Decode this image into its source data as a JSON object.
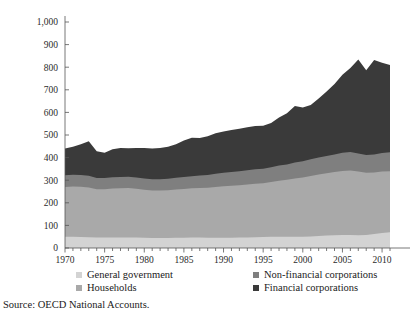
{
  "chart_data": {
    "type": "area",
    "title": "",
    "subtitle": "",
    "xlabel": "",
    "ylabel": "",
    "stacked": true,
    "grid": false,
    "legend_position": "bottom",
    "xlim": [
      1970,
      2011
    ],
    "ylim": [
      0,
      1000
    ],
    "ytick_values": [
      0,
      100,
      200,
      300,
      400,
      500,
      600,
      700,
      800,
      900,
      1000
    ],
    "ytick_labels": [
      "0",
      "100",
      "200",
      "300",
      "400",
      "500",
      "600",
      "700",
      "800",
      "900",
      "1,000"
    ],
    "xtick_values": [
      1970,
      1975,
      1980,
      1985,
      1990,
      1995,
      2000,
      2005,
      2010
    ],
    "xtick_labels": [
      "1970",
      "1975",
      "1980",
      "1985",
      "1990",
      "1995",
      "2000",
      "2005",
      "2010"
    ],
    "x": [
      1970,
      1971,
      1972,
      1973,
      1974,
      1975,
      1976,
      1977,
      1978,
      1979,
      1980,
      1981,
      1982,
      1983,
      1984,
      1985,
      1986,
      1987,
      1988,
      1989,
      1990,
      1991,
      1992,
      1993,
      1994,
      1995,
      1996,
      1997,
      1998,
      1999,
      2000,
      2001,
      2002,
      2003,
      2004,
      2005,
      2006,
      2007,
      2008,
      2009,
      2010,
      2011
    ],
    "series": [
      {
        "name": "General government",
        "color": "#d3d3d3",
        "values": [
          50,
          50,
          49,
          48,
          46,
          46,
          47,
          47,
          47,
          46,
          45,
          44,
          44,
          44,
          45,
          45,
          46,
          46,
          45,
          45,
          45,
          45,
          46,
          47,
          48,
          49,
          50,
          50,
          50,
          50,
          50,
          51,
          53,
          55,
          56,
          57,
          57,
          56,
          57,
          62,
          66,
          70
        ]
      },
      {
        "name": "Households",
        "color": "#a9a9a9",
        "values": [
          220,
          222,
          222,
          220,
          214,
          214,
          216,
          217,
          218,
          216,
          213,
          210,
          210,
          211,
          214,
          216,
          218,
          220,
          222,
          225,
          228,
          230,
          232,
          234,
          236,
          238,
          242,
          248,
          252,
          258,
          262,
          268,
          272,
          276,
          280,
          284,
          286,
          282,
          276,
          272,
          272,
          270
        ]
      },
      {
        "name": "Non-financial corporations",
        "color": "#7f7f7f",
        "values": [
          52,
          52,
          52,
          52,
          50,
          50,
          50,
          50,
          50,
          50,
          50,
          50,
          50,
          51,
          52,
          53,
          54,
          55,
          56,
          58,
          60,
          61,
          62,
          63,
          64,
          64,
          65,
          67,
          68,
          70,
          72,
          74,
          75,
          76,
          78,
          80,
          82,
          80,
          78,
          80,
          82,
          84
        ]
      },
      {
        "name": "Financial corporations",
        "color": "#3a3a3a",
        "values": [
          118,
          124,
          136,
          152,
          118,
          112,
          124,
          128,
          126,
          130,
          134,
          136,
          138,
          142,
          148,
          162,
          170,
          166,
          172,
          180,
          182,
          186,
          188,
          190,
          192,
          190,
          196,
          212,
          226,
          250,
          238,
          240,
          262,
          286,
          312,
          346,
          372,
          416,
          376,
          418,
          400,
          386
        ]
      }
    ],
    "totals_note": "stacked totals range from about 440 in 1970 to a peak near 940 in 2007"
  },
  "legend": {
    "entries": [
      {
        "label": "General government",
        "color": "#d3d3d3"
      },
      {
        "label": "Households",
        "color": "#a9a9a9"
      },
      {
        "label": "Non-financial corporations",
        "color": "#7f7f7f"
      },
      {
        "label": "Financial corporations",
        "color": "#3a3a3a"
      }
    ]
  },
  "source": {
    "text": "Source: OECD National Accounts."
  }
}
